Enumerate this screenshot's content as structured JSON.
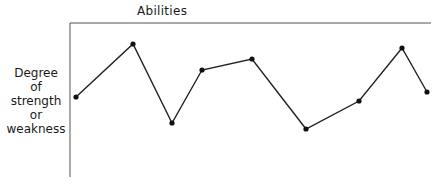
{
  "chart_data": {
    "type": "line",
    "title": "Abilities",
    "xlabel": "",
    "ylabel": "Degree of strength or weakness",
    "ylabel_lines": [
      "Degree",
      "of",
      "strength",
      "or",
      "weakness"
    ],
    "grid": false,
    "legend": null,
    "x": [
      1,
      2,
      3,
      4,
      5,
      6,
      7,
      8,
      9
    ],
    "values": [
      60,
      100,
      40,
      80,
      88,
      35,
      57,
      96,
      63
    ],
    "ylim": [
      0,
      115
    ],
    "pixel_points": [
      [
        76,
        97
      ],
      [
        133,
        44
      ],
      [
        172,
        123
      ],
      [
        202,
        70
      ],
      [
        252,
        59
      ],
      [
        306,
        129
      ],
      [
        359,
        101
      ],
      [
        402,
        48
      ],
      [
        427,
        92
      ]
    ],
    "line_color": "#222222"
  }
}
